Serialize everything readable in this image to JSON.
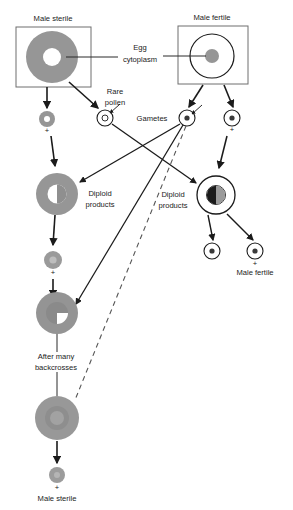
{
  "diagram": {
    "title_visible": false,
    "type": "cytoplasmic-male-sterility-breeding-scheme",
    "colors": {
      "sterile_cytoplasm_gray": "#969696",
      "fertile_outline_black": "#1b1b1b",
      "background": "#ffffff",
      "line": "#2b2b2b",
      "text": "#1b1b1b"
    },
    "labels": {
      "male_sterile_top": "Male sterile",
      "male_fertile_top": "Male fertile",
      "egg_cytoplasm": "Egg\ncytoplasm",
      "egg_cytoplasm_line1": "Egg",
      "egg_cytoplasm_line2": "cytoplasm",
      "rare_pollen_line1": "Rare",
      "rare_pollen_line2": "pollen",
      "gametes": "Gametes",
      "diploid_products_left_line1": "Diploid",
      "diploid_products_left_line2": "products",
      "diploid_products_right_line1": "Diploid",
      "diploid_products_right_line2": "products",
      "male_fertile_offspring": "Male fertile",
      "after_many_backcrosses_line1": "After many",
      "after_many_backcrosses_line2": "backcrosses",
      "male_sterile_bottom": "Male sterile",
      "plus_sign": "+"
    },
    "cells": [
      {
        "id": "male-sterile-egg",
        "name": "male-sterile-egg-cell",
        "cx": 52,
        "cy": 57,
        "r": 26,
        "style": "gray-filled-ring-white-center",
        "inner_r": 9
      },
      {
        "id": "male-fertile-egg",
        "name": "male-fertile-egg-cell",
        "cx": 212,
        "cy": 56,
        "r": 22,
        "style": "white-outline-gray-center",
        "inner_r": 7
      },
      {
        "id": "sterile-gamete",
        "name": "male-sterile-gamete",
        "cx": 47,
        "cy": 119,
        "r": 8,
        "style": "gray-filled-ring-white-center",
        "inner_r": 3
      },
      {
        "id": "rare-pollen",
        "name": "rare-pollen-gamete",
        "cx": 105,
        "cy": 118,
        "r": 8,
        "style": "white-outline-small-center",
        "inner_r": 3
      },
      {
        "id": "fertile-gamete-left",
        "name": "male-fertile-gamete-left",
        "cx": 187,
        "cy": 118,
        "r": 8,
        "style": "white-outline-small-center",
        "inner_r": 3
      },
      {
        "id": "fertile-gamete-right",
        "name": "male-fertile-gamete-right",
        "cx": 232,
        "cy": 118,
        "r": 8,
        "style": "white-outline-small-center",
        "inner_r": 3
      },
      {
        "id": "diploid-left",
        "name": "diploid-product-sterile",
        "cx": 57,
        "cy": 194,
        "r": 21,
        "style": "gray-ring-half-nucleus",
        "inner_r": 9
      },
      {
        "id": "diploid-right",
        "name": "diploid-product-fertile",
        "cx": 216,
        "cy": 195,
        "r": 19,
        "style": "white-ring-half-nucleus",
        "inner_r": 9
      },
      {
        "id": "offspring-left",
        "name": "male-fertile-offspring-left",
        "cx": 212,
        "cy": 251,
        "r": 8,
        "style": "white-outline-small-center",
        "inner_r": 3
      },
      {
        "id": "offspring-right",
        "name": "male-fertile-offspring-right",
        "cx": 255,
        "cy": 251,
        "r": 8,
        "style": "white-outline-small-center",
        "inner_r": 3
      },
      {
        "id": "backcross-gamete",
        "name": "backcross-gamete",
        "cx": 53,
        "cy": 260,
        "r": 9,
        "style": "gray-filled-small-nucleus",
        "inner_r": 4
      },
      {
        "id": "backcross-zygote",
        "name": "backcross-zygote",
        "cx": 57,
        "cy": 313,
        "r": 21,
        "style": "gray-ring-quarter-nucleus",
        "inner_r": 11
      },
      {
        "id": "final-plant",
        "name": "final-male-sterile-cell",
        "cx": 57,
        "cy": 418,
        "r": 22,
        "style": "gray-filled-soft-nucleus",
        "inner_r": 12
      },
      {
        "id": "final-gamete",
        "name": "final-male-sterile-gamete",
        "cx": 57,
        "cy": 475,
        "r": 8,
        "style": "gray-filled-small-nucleus",
        "inner_r": 3
      }
    ],
    "boxes": [
      {
        "id": "box-male-sterile",
        "name": "male-sterile-box",
        "x": 16,
        "y": 27,
        "w": 75,
        "h": 60
      },
      {
        "id": "box-male-fertile",
        "name": "male-fertile-box",
        "x": 178,
        "y": 26,
        "w": 70,
        "h": 58
      }
    ]
  }
}
